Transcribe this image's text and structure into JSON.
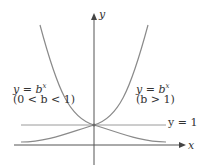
{
  "diagram": {
    "axes": {
      "x_label": "x",
      "y_label": "y"
    },
    "curves": [
      {
        "id": "decay",
        "equation_label": "y = b",
        "exponent": "x",
        "condition": "(0 < b < 1)"
      },
      {
        "id": "growth",
        "equation_label": "y = b",
        "exponent": "x",
        "condition": "(b > 1)"
      }
    ],
    "asymptote_line": {
      "label": "y = 1"
    },
    "intersection_point": {
      "x": 0,
      "y": 1
    },
    "colors": {
      "curve": "#8a8a8a",
      "axis": "#555555",
      "text": "#333333"
    }
  }
}
